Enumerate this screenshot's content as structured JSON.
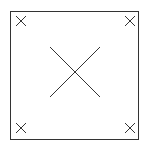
{
  "diagram": {
    "stroke_color": "#333333",
    "background": "#ffffff",
    "frame": {
      "x": 10.5,
      "y": 11.5,
      "width": 128,
      "height": 128
    },
    "center_cross": {
      "cx": 75,
      "cy": 72,
      "half": 25
    },
    "corner_crosses": [
      {
        "name": "top-left",
        "cx": 21,
        "cy": 21,
        "half": 5
      },
      {
        "name": "top-right",
        "cx": 130,
        "cy": 21,
        "half": 5
      },
      {
        "name": "bottom-left",
        "cx": 21,
        "cy": 128,
        "half": 5
      },
      {
        "name": "bottom-right",
        "cx": 130,
        "cy": 128,
        "half": 5
      }
    ]
  }
}
